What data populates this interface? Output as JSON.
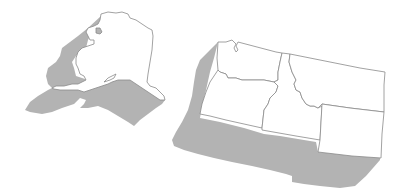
{
  "map": {
    "title": "",
    "regions": [
      {
        "id": "alaska",
        "name": "Alaska"
      },
      {
        "id": "washington",
        "name": "Washington"
      },
      {
        "id": "oregon",
        "name": "Oregon"
      },
      {
        "id": "idaho",
        "name": "Idaho"
      },
      {
        "id": "montana",
        "name": "Montana"
      },
      {
        "id": "wyoming",
        "name": "Wyoming"
      }
    ],
    "colors": {
      "state_fill": "#ffffff",
      "state_border": "#8a8a8a",
      "shadow": "#b3b3b3",
      "background": "#ffffff"
    }
  }
}
